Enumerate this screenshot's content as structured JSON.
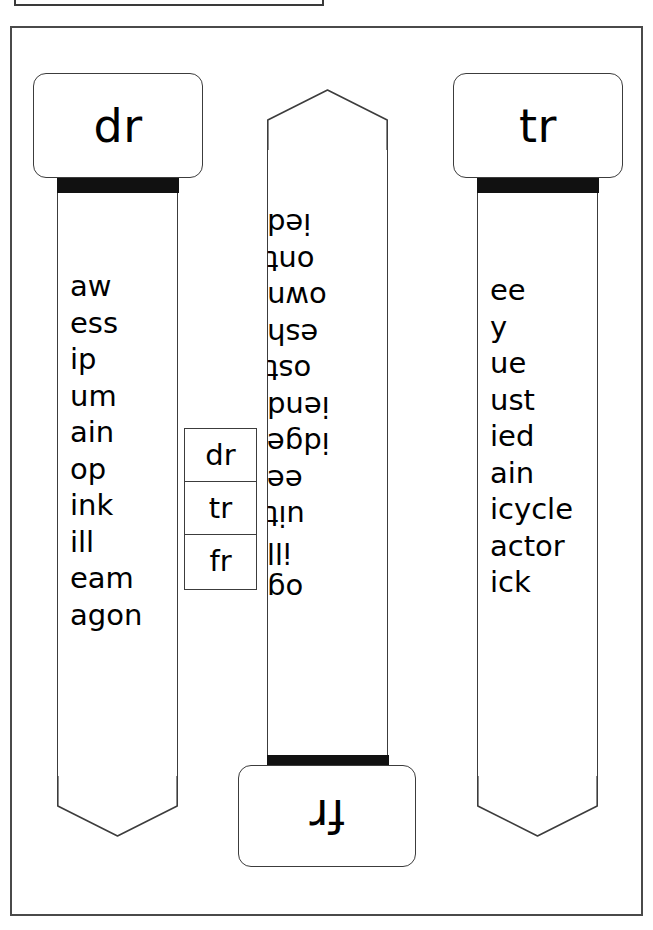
{
  "worksheet": {
    "title": "Consonant blend word strips",
    "ink_color": "#111111",
    "border_color": "#3c3c3c",
    "paper_color": "#ffffff"
  },
  "strips": [
    {
      "id": "dr",
      "label": "dr",
      "position": "left",
      "orientation": "upright",
      "words": [
        "aw",
        "ess",
        "ip",
        "um",
        "ain",
        "op",
        "ink",
        "ill",
        "eam",
        "agon"
      ]
    },
    {
      "id": "fr",
      "label": "fr",
      "position": "middle",
      "orientation": "rotated-180",
      "words": [
        "og",
        "ill",
        "uit",
        "ee",
        "idge",
        "iend",
        "ost",
        "esh",
        "own",
        "ont",
        "ied"
      ]
    },
    {
      "id": "tr",
      "label": "tr",
      "position": "right",
      "orientation": "upright",
      "words": [
        "ee",
        "y",
        "ue",
        "ust",
        "ied",
        "ain",
        "icycle",
        "actor",
        "ick"
      ]
    }
  ],
  "key_box": {
    "rows": [
      "dr",
      "tr",
      "fr"
    ]
  }
}
